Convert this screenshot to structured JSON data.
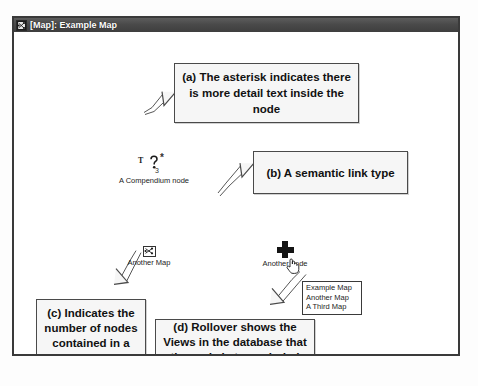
{
  "window": {
    "title": "[Map]: Example Map",
    "icon": "map-window-icon"
  },
  "callouts": [
    {
      "id": "a",
      "text": "(a) The asterisk indicates there is more detail text inside the node"
    },
    {
      "id": "b",
      "text": "(b) A semantic link type"
    },
    {
      "id": "c",
      "text": "(c) Indicates the number of nodes contained in a view"
    },
    {
      "id": "d",
      "text": "(d) Rollover shows the Views in the database that the node is transcluded into"
    }
  ],
  "nodes": {
    "question": {
      "label": "A Compendium node",
      "type_letter": "T",
      "asterisk": "*",
      "count": "3",
      "icon": "question-node-icon"
    },
    "map": {
      "label": "Another Map",
      "icon": "map-node-icon"
    },
    "plus": {
      "label": "Another node",
      "icon": "plus-node-icon"
    }
  },
  "rollover": {
    "items": [
      "Example Map",
      "Another Map",
      "A Third Map"
    ]
  },
  "colors": {
    "titlebar": "#4a4a4a",
    "window_border": "#3a3a3a",
    "callout_fill": "#f6f6f6",
    "callout_border": "#4a4a4a",
    "canvas": "#ffffff"
  }
}
